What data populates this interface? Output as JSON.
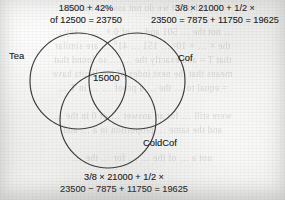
{
  "page": {
    "width": 285,
    "height": 200,
    "background_color": "#eeeeec",
    "ink_color": "#27272a"
  },
  "annotations": {
    "top_left": {
      "line1": "18500 + 42%",
      "line2": "of 12500 = 23750"
    },
    "top_right": {
      "line1": "3/8 × 21000 + 1/2 ×",
      "line2": "23500 = 7875 + 11750 = 19625"
    },
    "bottom": {
      "line1": "3/8 × 21000 + 1/2 ×",
      "line2": "23500 − 7875 + 11750 = 19625"
    }
  },
  "venn": {
    "type": "three-set-venn",
    "stroke_color": "#3a3a3c",
    "fill": "none",
    "sets": [
      {
        "name": "tea",
        "label": "Tea",
        "cx": 78,
        "cy": 81,
        "r": 48
      },
      {
        "name": "cof",
        "label": "Cof",
        "cx": 137,
        "cy": 81,
        "r": 48
      },
      {
        "name": "coldcof",
        "label": "ColdCof",
        "cx": 108,
        "cy": 120,
        "r": 48
      }
    ],
    "center_region_value": "15000"
  },
  "bleed_through": {
    "lines": [
      "Actual point we do not assume that the",
      "… not the … 501 and … of 0 × … … say …",
      "the × … × 10² … 151 … 41° … are similar",
      "that T = and exactly the … … so found that",
      "means that the next index of our limits have",
      "= equal to … the … a proof … … in T …",
      "were still … for an answer … of 0 in the …",
      "and the same … proportion in a … and",
      "not a … of the … … for … the …"
    ]
  }
}
